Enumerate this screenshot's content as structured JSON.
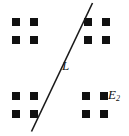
{
  "figure": {
    "kind": "lattice-with-line-diagram",
    "width": 129,
    "height": 136,
    "background_color": "#ffffff",
    "ink_color": "#111111"
  },
  "labels": {
    "line_label": "L",
    "set_label_base": "E",
    "set_label_subscript": "2"
  },
  "line": {
    "name": "L",
    "stroke_color": "#1a1a1a",
    "stroke_width": 1.6,
    "x1": 31.5,
    "y1": 131.5,
    "x2": 92.5,
    "y2": 3.0
  },
  "chart_data": {
    "type": "scatter",
    "title": "",
    "xlabel": "",
    "ylabel": "",
    "grid": false,
    "legend": null,
    "annotations": [
      {
        "text": "L",
        "x": 65,
        "y": 66,
        "style": "italic"
      },
      {
        "text": "E2",
        "x": 108,
        "y": 96,
        "style": "italic-subscript"
      }
    ],
    "marker": {
      "shape": "square",
      "size": 8,
      "color": "#111111"
    },
    "clusters": [
      {
        "name": "top-left-cluster",
        "points": [
          {
            "x": 12,
            "y": 18
          },
          {
            "x": 30,
            "y": 18
          },
          {
            "x": 12,
            "y": 36
          },
          {
            "x": 30,
            "y": 36
          }
        ]
      },
      {
        "name": "top-right-cluster",
        "points": [
          {
            "x": 84,
            "y": 18
          },
          {
            "x": 102,
            "y": 18
          },
          {
            "x": 84,
            "y": 36
          },
          {
            "x": 102,
            "y": 36
          }
        ]
      },
      {
        "name": "bottom-left-cluster",
        "points": [
          {
            "x": 12,
            "y": 92
          },
          {
            "x": 30,
            "y": 92
          },
          {
            "x": 12,
            "y": 110
          },
          {
            "x": 30,
            "y": 110
          }
        ]
      },
      {
        "name": "bottom-right-cluster",
        "points": [
          {
            "x": 82,
            "y": 92
          },
          {
            "x": 100,
            "y": 92
          },
          {
            "x": 82,
            "y": 110
          },
          {
            "x": 100,
            "y": 110
          }
        ]
      }
    ]
  }
}
